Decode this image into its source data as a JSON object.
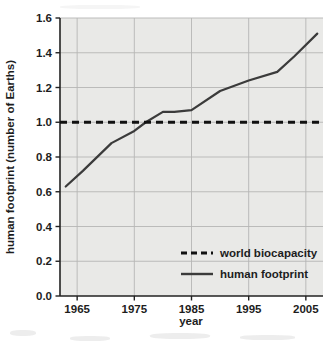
{
  "chart_data": {
    "type": "line",
    "title": "",
    "xlabel": "year",
    "ylabel": "human footprint (number of Earths)",
    "xlim": [
      1962,
      2008
    ],
    "ylim": [
      0.0,
      1.6
    ],
    "grid": true,
    "legend_position": "lower-right-inside",
    "x_ticks": [
      1965,
      1975,
      1985,
      1995,
      2005
    ],
    "x_tick_labels": [
      "1965",
      "1975",
      "1985",
      "1995",
      "2005"
    ],
    "y_ticks": [
      0.0,
      0.2,
      0.4,
      0.6,
      0.8,
      1.0,
      1.2,
      1.4,
      1.6
    ],
    "y_tick_labels": [
      "0.0",
      "0.2",
      "0.4",
      "0.6",
      "0.8",
      "1.0",
      "1.2",
      "1.4",
      "1.6"
    ],
    "series": [
      {
        "name": "world biocapacity",
        "style": "dashed",
        "color": "#111111",
        "x": [
          1962,
          2008
        ],
        "values": [
          1.0,
          1.0
        ]
      },
      {
        "name": "human footprint",
        "style": "solid",
        "color": "#3b3b3b",
        "x": [
          1963,
          1966,
          1971,
          1975,
          1977,
          1980,
          1982,
          1985,
          1990,
          1995,
          2000,
          2003,
          2007
        ],
        "values": [
          0.63,
          0.72,
          0.88,
          0.95,
          1.0,
          1.06,
          1.06,
          1.07,
          1.18,
          1.24,
          1.29,
          1.38,
          1.51
        ]
      }
    ]
  },
  "legend": {
    "items": [
      {
        "label": "world biocapacity",
        "style": "dashed"
      },
      {
        "label": "human footprint",
        "style": "solid"
      }
    ]
  },
  "colors": {
    "plot_background": "#e9e9e7",
    "page_background": "#ffffff",
    "axis": "#222222",
    "grid": "#b6b6b4",
    "biocapacity_line": "#111111",
    "footprint_line": "#3b3b3b"
  }
}
